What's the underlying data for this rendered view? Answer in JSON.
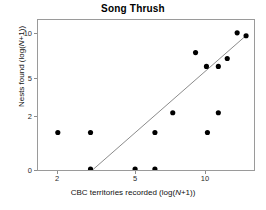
{
  "chart_data": {
    "type": "scatter",
    "title": "Song Thrush",
    "xlabel": "CBC territories recorded (log(N+1))",
    "ylabel": "Nests found (log(N+1))",
    "xlabel_parts": {
      "prefix": "CBC territories recorded (log(",
      "italic": "N",
      "suffix": "+1))"
    },
    "ylabel_parts": {
      "prefix": "Nests found (log(",
      "italic": "N",
      "suffix": "+1))"
    },
    "x_ticks": [
      2,
      5,
      10
    ],
    "x_tick_labels": [
      "2",
      "5",
      "10"
    ],
    "y_ticks": [
      0,
      2,
      5,
      10
    ],
    "y_tick_labels": [
      "0",
      "2",
      "5",
      "10"
    ],
    "xlim": [
      1.2,
      15.5
    ],
    "ylim": [
      0,
      12.5
    ],
    "grid": false,
    "legend": null,
    "scale_note": "both axes are log(N+1) transformed, so tick spacing is non-linear",
    "points": [
      {
        "x": 2.0,
        "y": 1.0
      },
      {
        "x": 3.0,
        "y": 1.0
      },
      {
        "x": 3.0,
        "y": 0.0
      },
      {
        "x": 5.0,
        "y": 0.0
      },
      {
        "x": 6.2,
        "y": 0.0
      },
      {
        "x": 6.2,
        "y": 1.0
      },
      {
        "x": 7.3,
        "y": 3.0
      },
      {
        "x": 9.3,
        "y": 9.3
      },
      {
        "x": 10.0,
        "y": 1.0
      },
      {
        "x": 10.0,
        "y": 6.1
      },
      {
        "x": 10.8,
        "y": 3.0
      },
      {
        "x": 10.8,
        "y": 6.1
      },
      {
        "x": 11.5,
        "y": 8.0
      },
      {
        "x": 12.8,
        "y": 10.8
      },
      {
        "x": 13.6,
        "y": 10.2
      }
    ],
    "points_px": [
      {
        "x": 57,
        "y": 133
      },
      {
        "x": 90,
        "y": 133
      },
      {
        "x": 90,
        "y": 170
      },
      {
        "x": 135,
        "y": 170
      },
      {
        "x": 155,
        "y": 170
      },
      {
        "x": 155,
        "y": 133
      },
      {
        "x": 173,
        "y": 113
      },
      {
        "x": 196,
        "y": 52
      },
      {
        "x": 208,
        "y": 133
      },
      {
        "x": 207,
        "y": 66
      },
      {
        "x": 219,
        "y": 113
      },
      {
        "x": 219,
        "y": 66
      },
      {
        "x": 228,
        "y": 58
      },
      {
        "x": 238,
        "y": 32
      },
      {
        "x": 247,
        "y": 35
      }
    ],
    "trend_line": {
      "type": "regression",
      "start_px": {
        "x": 92,
        "y": 171
      },
      "end_px": {
        "x": 249,
        "y": 33
      },
      "color": "#8a8a8a"
    },
    "marker": {
      "shape": "circle",
      "color": "#000000",
      "size_px": 4
    },
    "axis_color": "#9a9a9a",
    "tick_px": {
      "x": {
        "2": 57,
        "5": 135,
        "10": 205
      },
      "y": {
        "0": 170,
        "2": 116,
        "5": 78,
        "10": 33
      }
    }
  }
}
